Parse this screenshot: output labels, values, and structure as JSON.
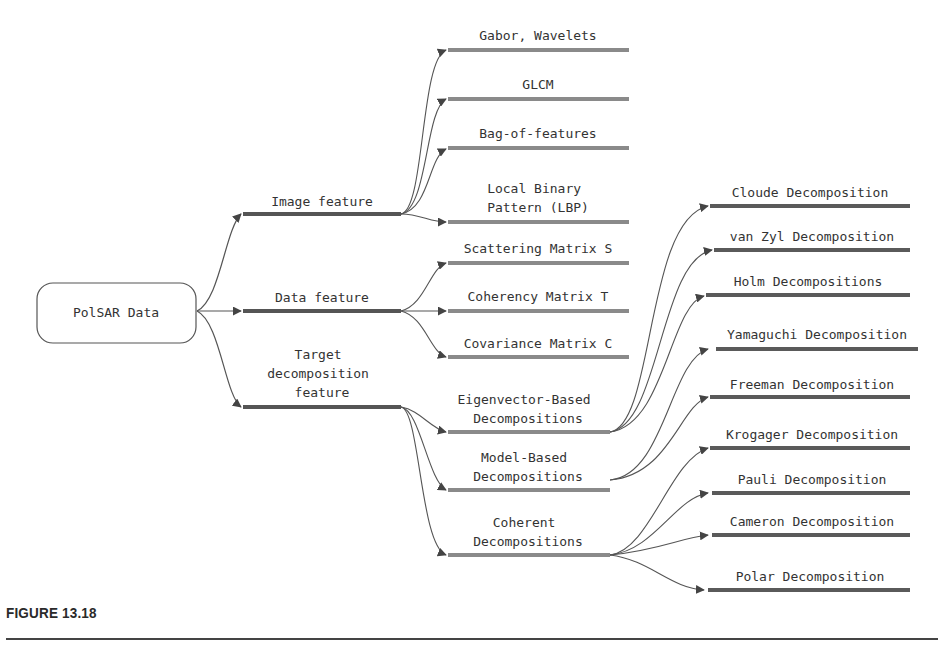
{
  "diagram": {
    "root": {
      "label": "PolSAR Data"
    },
    "level1": [
      {
        "label": [
          "Image feature"
        ]
      },
      {
        "label": [
          "Data feature"
        ]
      },
      {
        "label": [
          "Target",
          "decomposition",
          "feature"
        ]
      }
    ],
    "image_feature_children": [
      {
        "label": [
          "Gabor, Wavelets"
        ]
      },
      {
        "label": [
          "GLCM"
        ]
      },
      {
        "label": [
          "Bag-of-features"
        ]
      },
      {
        "label": [
          "Local Binary",
          "Pattern (LBP)"
        ]
      }
    ],
    "data_feature_children": [
      {
        "label": [
          "Scattering Matrix S"
        ]
      },
      {
        "label": [
          "Coherency Matrix T"
        ]
      },
      {
        "label": [
          "Covariance Matrix C"
        ]
      }
    ],
    "target_children": [
      {
        "label": [
          "Eigenvector-Based",
          "Decompositions"
        ]
      },
      {
        "label": [
          "Model-Based",
          "Decompositions"
        ]
      },
      {
        "label": [
          "Coherent",
          "Decompositions"
        ]
      }
    ],
    "eigenvector_children": [
      {
        "label": "Cloude Decomposition"
      },
      {
        "label": "van Zyl Decomposition"
      },
      {
        "label": "Holm Decompositions"
      }
    ],
    "model_children": [
      {
        "label": "Yamaguchi Decomposition"
      },
      {
        "label": "Freeman Decomposition"
      }
    ],
    "coherent_children": [
      {
        "label": "Krogager Decomposition"
      },
      {
        "label": "Pauli Decomposition"
      },
      {
        "label": "Cameron Decomposition"
      },
      {
        "label": "Polar Decomposition"
      }
    ]
  },
  "caption": {
    "label": "FIGURE 13.18"
  },
  "colors": {
    "line": "#555555",
    "bar": "#8a8a8a",
    "bar_dark": "#5a5a5a",
    "text": "#333333"
  }
}
